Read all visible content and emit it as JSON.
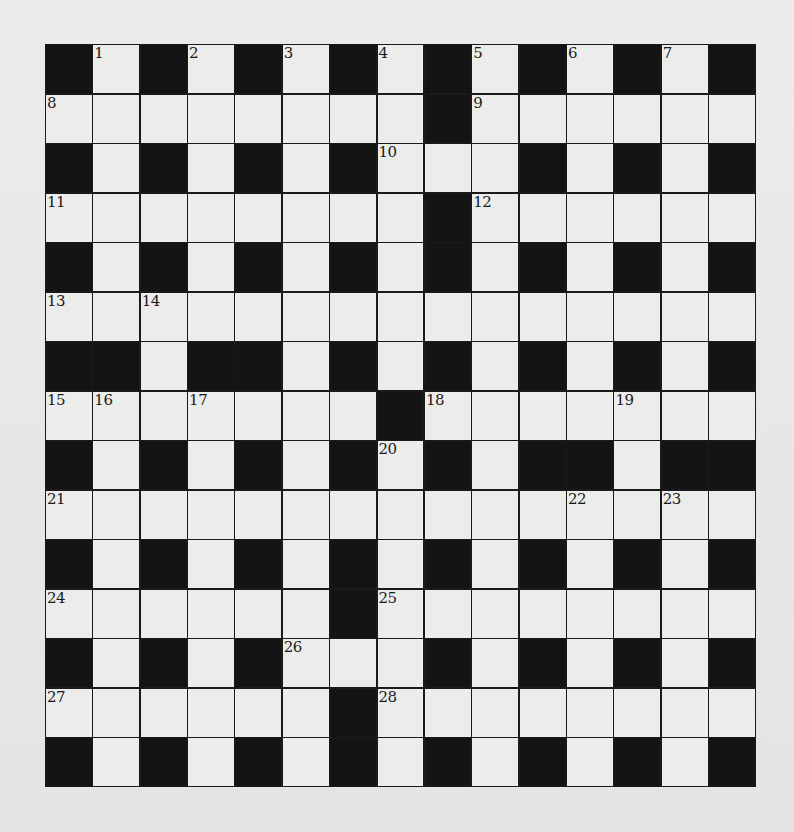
{
  "puzzle": {
    "type": "crossword",
    "rows": 15,
    "cols": 15,
    "colors": {
      "background": "#e8e8e6",
      "white_cell": "#ececea",
      "black_cell": "#141414",
      "grid_line": "#1a1a1a"
    },
    "layout": [
      "#.#.#.#.#.#.#.#",
      "........#......",
      "#.#.#.#...#.#.#",
      "........#......",
      "#.#.#.#.#.#.#.#",
      "...............",
      "##.##.#.#.#.#.#",
      ".......#.......",
      "#.#.#.#.#.##.##",
      "...............",
      "#.#.#.#.#.#.#.#",
      "......#........",
      "#.#.#...#.#.#.#",
      "......#........",
      "#.#.#.#.#.#.#.#"
    ],
    "numbers": [
      {
        "n": "1",
        "row": 0,
        "col": 1
      },
      {
        "n": "2",
        "row": 0,
        "col": 3
      },
      {
        "n": "3",
        "row": 0,
        "col": 5
      },
      {
        "n": "4",
        "row": 0,
        "col": 7
      },
      {
        "n": "5",
        "row": 0,
        "col": 9
      },
      {
        "n": "6",
        "row": 0,
        "col": 11
      },
      {
        "n": "7",
        "row": 0,
        "col": 13
      },
      {
        "n": "8",
        "row": 1,
        "col": 0
      },
      {
        "n": "9",
        "row": 1,
        "col": 9
      },
      {
        "n": "10",
        "row": 2,
        "col": 7
      },
      {
        "n": "11",
        "row": 3,
        "col": 0
      },
      {
        "n": "12",
        "row": 3,
        "col": 9
      },
      {
        "n": "13",
        "row": 5,
        "col": 0
      },
      {
        "n": "14",
        "row": 5,
        "col": 2
      },
      {
        "n": "15",
        "row": 7,
        "col": 0
      },
      {
        "n": "16",
        "row": 7,
        "col": 1
      },
      {
        "n": "17",
        "row": 7,
        "col": 3
      },
      {
        "n": "18",
        "row": 7,
        "col": 8
      },
      {
        "n": "19",
        "row": 7,
        "col": 12
      },
      {
        "n": "20",
        "row": 8,
        "col": 7
      },
      {
        "n": "21",
        "row": 9,
        "col": 0
      },
      {
        "n": "22",
        "row": 9,
        "col": 11
      },
      {
        "n": "23",
        "row": 9,
        "col": 13
      },
      {
        "n": "24",
        "row": 11,
        "col": 0
      },
      {
        "n": "25",
        "row": 11,
        "col": 7
      },
      {
        "n": "26",
        "row": 12,
        "col": 5
      },
      {
        "n": "27",
        "row": 13,
        "col": 0
      },
      {
        "n": "28",
        "row": 13,
        "col": 7
      }
    ]
  }
}
